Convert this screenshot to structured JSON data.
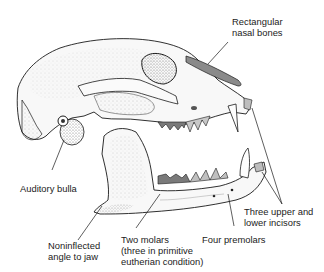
{
  "figure": {
    "colors": {
      "outline": "#1a1a1a",
      "bone_fill": "#f7f7f7",
      "stipple": "#9a9a9a",
      "molar_highlight": "#7a7a7a",
      "premolar_highlight": "#bdbdbd",
      "nasal_highlight": "#8a8a8a"
    }
  },
  "labels": {
    "nasal_bones": "Rectangular\nnasal bones",
    "auditory_bulla": "Auditory bulla",
    "jaw_angle": "Noninflected\nangle to jaw",
    "molars": "Two molars\n(three in primitive\neutherian condition)",
    "premolars": "Four premolars",
    "incisors": "Three upper and\nlower incisors"
  }
}
